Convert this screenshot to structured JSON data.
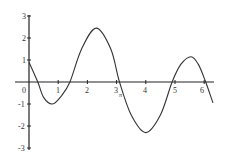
{
  "chart_data": {
    "type": "line",
    "title": "",
    "xlabel": "",
    "ylabel": "",
    "xlim": [
      -0.5,
      6.3
    ],
    "ylim": [
      -3,
      3
    ],
    "grid": false,
    "legend": null,
    "x_ticks": [
      "0",
      "1",
      "2",
      "3",
      "4",
      "5",
      "6"
    ],
    "y_ticks": [
      "3",
      "2",
      "1",
      "-1",
      "-2",
      "-3"
    ],
    "annotations": [
      {
        "text": "π",
        "x": 3.14159,
        "y": 0,
        "position": "below axis near tick 3"
      }
    ],
    "series": [
      {
        "name": "f(x)",
        "x": [
          0,
          0.3,
          0.5,
          0.8,
          1.1,
          1.4,
          1.8,
          2.3,
          2.8,
          3.1,
          3.5,
          4.0,
          4.5,
          4.9,
          5.2,
          5.55,
          5.8,
          6.05,
          6.3
        ],
        "y": [
          0.9,
          0,
          -0.7,
          -1.0,
          -0.65,
          0,
          1.5,
          2.45,
          1.5,
          0,
          -1.5,
          -2.3,
          -1.5,
          0,
          0.8,
          1.15,
          0.8,
          0,
          -0.95
        ]
      }
    ]
  },
  "axis": {
    "x_labels": [
      {
        "text": "0",
        "value": 0
      },
      {
        "text": "1",
        "value": 1
      },
      {
        "text": "2",
        "value": 2
      },
      {
        "text": "3",
        "value": 3
      },
      {
        "text": "4",
        "value": 4
      },
      {
        "text": "5",
        "value": 5
      },
      {
        "text": "6",
        "value": 6
      }
    ],
    "y_labels": [
      {
        "text": "3",
        "value": 3
      },
      {
        "text": "2",
        "value": 2
      },
      {
        "text": "1",
        "value": 1
      },
      {
        "text": "-1",
        "value": -1
      },
      {
        "text": "-2",
        "value": -2
      },
      {
        "text": "-3",
        "value": -3
      }
    ],
    "pi_marker": "π"
  }
}
